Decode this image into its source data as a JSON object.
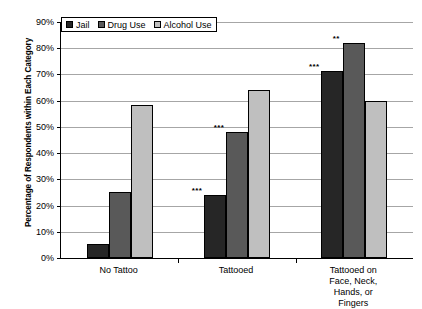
{
  "chart_data": {
    "type": "bar",
    "title": "",
    "xlabel": "",
    "ylabel": "Percentage of Respondents within Each Category",
    "categories": [
      "No Tattoo",
      "Tattooed",
      "Tattooed on Face, Neck,\nHands, or Fingers"
    ],
    "series": [
      {
        "name": "Jail",
        "color": "#262626",
        "values": [
          5.5,
          24.0,
          71.5
        ]
      },
      {
        "name": "Drug Use",
        "color": "#595959",
        "values": [
          25.0,
          48.0,
          82.0
        ]
      },
      {
        "name": "Alcohol Use",
        "color": "#bfbfbf",
        "values": [
          58.5,
          64.0,
          60.0
        ]
      }
    ],
    "annotations": [
      {
        "category": "Tattooed",
        "series": "Jail",
        "text": "***"
      },
      {
        "category": "Tattooed",
        "series": "Drug Use",
        "text": "***"
      },
      {
        "category": "Tattooed on Face, Neck, Hands, or Fingers",
        "series": "Jail",
        "text": "***"
      },
      {
        "category": "Tattooed on Face, Neck, Hands, or Fingers",
        "series": "Drug Use",
        "text": "**"
      }
    ],
    "ylim": [
      0,
      90
    ],
    "ytick_labels": [
      "0%",
      "10%",
      "20%",
      "30%",
      "40%",
      "50%",
      "60%",
      "70%",
      "80%",
      "90%"
    ],
    "ytick_values": [
      0,
      10,
      20,
      30,
      40,
      50,
      60,
      70,
      80,
      90
    ],
    "grid": true,
    "legend_position": "top-left"
  },
  "legend": {
    "entries": [
      {
        "label": "Jail"
      },
      {
        "label": "Drug Use"
      },
      {
        "label": "Alcohol Use"
      }
    ]
  }
}
